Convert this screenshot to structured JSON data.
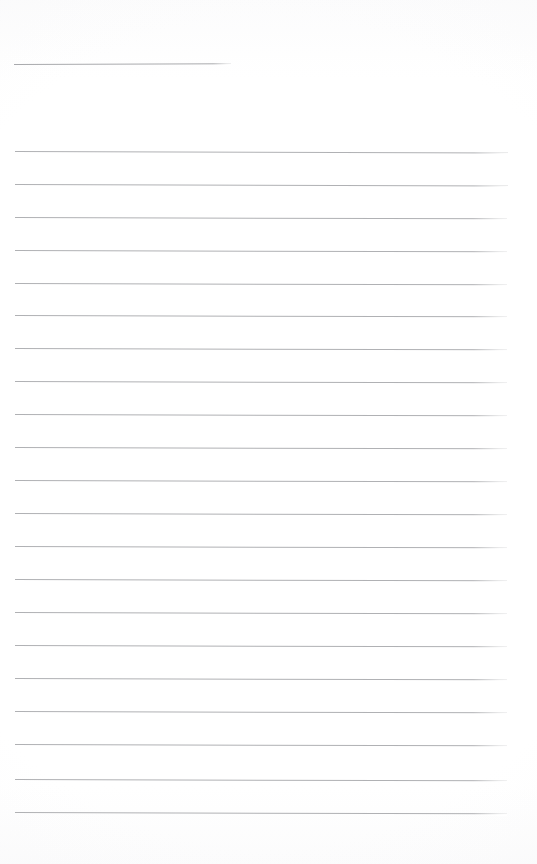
{
  "document": {
    "kind": "scanned-blank-lined-notepaper",
    "page_label": "",
    "text_content": "",
    "background_color": "#ffffff",
    "rule_color": "#b0b1b4",
    "header_rule_color": "#a9aaad",
    "page_width": 537,
    "page_height": 864
  },
  "header_rule": {
    "name": "title-line",
    "x": 14,
    "y": 64,
    "width": 217,
    "skew_deg": -0.18,
    "thickness": 1
  },
  "rules": [
    {
      "y": 151,
      "x": 15,
      "width": 493,
      "skew_deg": 0.16
    },
    {
      "y": 184,
      "x": 15,
      "width": 493,
      "skew_deg": 0.16
    },
    {
      "y": 217,
      "x": 15,
      "width": 492,
      "skew_deg": 0.16
    },
    {
      "y": 250,
      "x": 15,
      "width": 492,
      "skew_deg": 0.16
    },
    {
      "y": 283,
      "x": 15,
      "width": 492,
      "skew_deg": 0.16
    },
    {
      "y": 315,
      "x": 15,
      "width": 492,
      "skew_deg": 0.16
    },
    {
      "y": 348,
      "x": 15,
      "width": 492,
      "skew_deg": 0.16
    },
    {
      "y": 381,
      "x": 15,
      "width": 492,
      "skew_deg": 0.16
    },
    {
      "y": 414,
      "x": 15,
      "width": 492,
      "skew_deg": 0.16
    },
    {
      "y": 447,
      "x": 15,
      "width": 492,
      "skew_deg": 0.16
    },
    {
      "y": 480,
      "x": 15,
      "width": 492,
      "skew_deg": 0.16
    },
    {
      "y": 513,
      "x": 15,
      "width": 492,
      "skew_deg": 0.16
    },
    {
      "y": 546,
      "x": 15,
      "width": 492,
      "skew_deg": 0.16
    },
    {
      "y": 579,
      "x": 15,
      "width": 492,
      "skew_deg": 0.16
    },
    {
      "y": 612,
      "x": 15,
      "width": 492,
      "skew_deg": 0.16
    },
    {
      "y": 645,
      "x": 15,
      "width": 492,
      "skew_deg": 0.16
    },
    {
      "y": 678,
      "x": 15,
      "width": 492,
      "skew_deg": 0.16
    },
    {
      "y": 711,
      "x": 15,
      "width": 492,
      "skew_deg": 0.16
    },
    {
      "y": 744,
      "x": 15,
      "width": 492,
      "skew_deg": 0.16
    },
    {
      "y": 779,
      "x": 15,
      "width": 492,
      "skew_deg": 0.16
    },
    {
      "y": 812,
      "x": 15,
      "width": 492,
      "skew_deg": 0.16
    }
  ]
}
